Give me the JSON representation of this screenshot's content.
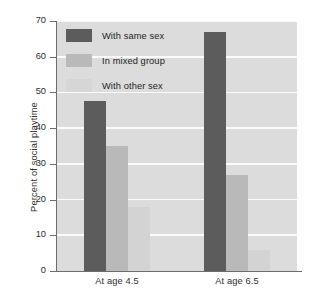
{
  "chart_data": {
    "type": "bar",
    "title": "",
    "xlabel": "",
    "ylabel": "Percent of social playtime",
    "categories": [
      "At age 4.5",
      "At age 6.5"
    ],
    "series": [
      {
        "name": "With same sex",
        "values": [
          47.5,
          67
        ],
        "color": "#5c5c5c"
      },
      {
        "name": "In mixed group",
        "values": [
          35,
          27
        ],
        "color": "#b9b9b9"
      },
      {
        "name": "With other sex",
        "values": [
          18,
          6
        ],
        "color": "#d3d3d3"
      }
    ],
    "ylim": [
      0,
      70
    ],
    "yticks": [
      0,
      10,
      20,
      30,
      40,
      50,
      60,
      70
    ],
    "ytick_labels": [
      "0",
      "10",
      "20",
      "30",
      "40",
      "50",
      "60",
      "70"
    ],
    "grid": "horizontal",
    "legend_position": "upper-left-inside",
    "plot_background": "#dcdcdc",
    "gridline_color": "#fbfbfb",
    "axis_color": "#6d6d6d"
  }
}
